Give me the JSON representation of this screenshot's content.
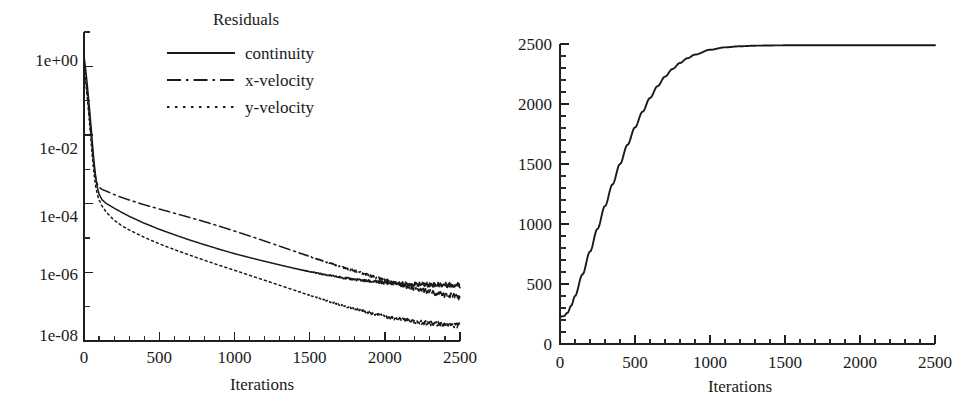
{
  "figure": {
    "background": "#ffffff",
    "ink": "#1a1a1a",
    "panel_count": 2
  },
  "chart_data": [
    {
      "id": "residuals-plot",
      "type": "line",
      "title": "Residuals",
      "xlabel": "Iterations",
      "ylabel": "",
      "yscale": "log",
      "xlim": [
        0,
        2500
      ],
      "ylim": [
        1e-08,
        10
      ],
      "grid": false,
      "legend_position": "top-center",
      "xticks": [
        0,
        500,
        1000,
        1500,
        2000,
        2500
      ],
      "xticklabels": [
        "0",
        "500",
        "1000",
        "1500",
        "2000",
        "2500"
      ],
      "yticks": [
        1,
        0.01,
        0.0001,
        1e-06,
        1e-08
      ],
      "yticklabels": [
        "1e+00",
        "1e-02",
        "1e-04",
        "1e-06",
        "1e-08"
      ],
      "minor_ticks": true,
      "series": [
        {
          "name": "continuity",
          "style": "solid",
          "x": [
            0,
            10,
            20,
            30,
            40,
            50,
            60,
            70,
            80,
            90,
            100,
            120,
            150,
            200,
            250,
            300,
            400,
            500,
            600,
            700,
            800,
            900,
            1000,
            1100,
            1200,
            1300,
            1400,
            1500,
            1600,
            1700,
            1800,
            1900,
            2000,
            2100,
            2200,
            2300,
            2400,
            2500
          ],
          "y": [
            2.0,
            0.9,
            0.35,
            0.12,
            0.04,
            0.012,
            0.0035,
            0.0012,
            0.0005,
            0.00028,
            0.00019,
            0.00013,
            0.0001,
            7.4e-05,
            5.6e-05,
            4.3e-05,
            2.7e-05,
            1.8e-05,
            1.25e-05,
            8.8e-06,
            6.4e-06,
            4.7e-06,
            3.5e-06,
            2.7e-06,
            2.1e-06,
            1.65e-06,
            1.3e-06,
            1.05e-06,
            8.6e-07,
            7.2e-07,
            6.2e-07,
            5.5e-07,
            5e-07,
            4.7e-07,
            4.5e-07,
            4.4e-07,
            4.35e-07,
            4.3e-07
          ]
        },
        {
          "name": "x-velocity",
          "style": "dash-dot",
          "x": [
            0,
            10,
            20,
            30,
            40,
            50,
            60,
            70,
            80,
            90,
            100,
            120,
            150,
            200,
            250,
            300,
            400,
            500,
            600,
            700,
            800,
            900,
            1000,
            1100,
            1200,
            1300,
            1400,
            1500,
            1600,
            1700,
            1800,
            1900,
            2000,
            2100,
            2200,
            2300,
            2400,
            2500
          ],
          "y": [
            1.2,
            0.5,
            0.2,
            0.07,
            0.022,
            0.007,
            0.0023,
            0.0009,
            0.0005,
            0.00036,
            0.0003,
            0.00026,
            0.00023,
            0.000185,
            0.000152,
            0.000128,
            9.3e-05,
            7e-05,
            5.3e-05,
            4e-05,
            3e-05,
            2.2e-05,
            1.6e-05,
            1.15e-05,
            8.2e-06,
            5.8e-06,
            4.1e-06,
            2.9e-06,
            2.05e-06,
            1.5e-06,
            1.1e-06,
            8e-07,
            6e-07,
            4.4e-07,
            3.4e-07,
            2.7e-07,
            2.2e-07,
            1.9e-07
          ]
        },
        {
          "name": "y-velocity",
          "style": "dotted",
          "x": [
            0,
            10,
            20,
            30,
            40,
            50,
            60,
            70,
            80,
            90,
            100,
            120,
            150,
            200,
            250,
            300,
            400,
            500,
            600,
            700,
            800,
            900,
            1000,
            1100,
            1200,
            1300,
            1400,
            1500,
            1600,
            1700,
            1800,
            1900,
            2000,
            2100,
            2200,
            2300,
            2400,
            2500
          ],
          "y": [
            1.0,
            0.4,
            0.15,
            0.05,
            0.015,
            0.0045,
            0.0014,
            0.00055,
            0.00028,
            0.00018,
            0.00013,
            8.6e-05,
            5.5e-05,
            3.3e-05,
            2.3e-05,
            1.72e-05,
            1.05e-05,
            6.8e-06,
            4.6e-06,
            3.2e-06,
            2.25e-06,
            1.6e-06,
            1.15e-06,
            8.2e-07,
            5.9e-07,
            4.2e-07,
            3e-07,
            2.15e-07,
            1.55e-07,
            1.15e-07,
            8.6e-08,
            6.6e-08,
            5.2e-08,
            4.3e-08,
            3.7e-08,
            3.3e-08,
            3e-08,
            2.8e-08
          ]
        }
      ]
    },
    {
      "id": "convergence-plot",
      "type": "line",
      "title": "",
      "xlabel": "Iterations",
      "ylabel": "",
      "yscale": "linear",
      "xlim": [
        0,
        2500
      ],
      "ylim": [
        0,
        2500
      ],
      "grid": false,
      "legend_position": "none",
      "xticks": [
        0,
        500,
        1000,
        1500,
        2000,
        2500
      ],
      "xticklabels": [
        "0",
        "500",
        "1000",
        "1500",
        "2000",
        "2500"
      ],
      "yticks": [
        0,
        500,
        1000,
        1500,
        2000,
        2500
      ],
      "yticklabels": [
        "0",
        "500",
        "1000",
        "1500",
        "2000",
        "2500"
      ],
      "minor_ticks": true,
      "series": [
        {
          "name": "value",
          "style": "solid",
          "x": [
            0,
            25,
            50,
            75,
            100,
            150,
            200,
            250,
            300,
            350,
            400,
            450,
            500,
            550,
            600,
            650,
            700,
            750,
            800,
            850,
            900,
            1000,
            1100,
            1200,
            1300,
            1400,
            1500,
            1600,
            1700,
            1800,
            1900,
            2000,
            2100,
            2200,
            2300,
            2400,
            2500
          ],
          "y": [
            228,
            232,
            260,
            320,
            400,
            580,
            770,
            960,
            1150,
            1330,
            1500,
            1660,
            1805,
            1935,
            2050,
            2148,
            2228,
            2292,
            2342,
            2382,
            2412,
            2452,
            2472,
            2481,
            2486,
            2488,
            2489,
            2490,
            2490,
            2490,
            2490,
            2490,
            2490,
            2490,
            2490,
            2490,
            2490
          ]
        }
      ]
    }
  ],
  "panels": {
    "left": {
      "legend": {
        "title": "Residuals",
        "entries": [
          {
            "label": "continuity",
            "style": "solid"
          },
          {
            "label": "x-velocity",
            "style": "dash-dot"
          },
          {
            "label": "y-velocity",
            "style": "dotted"
          }
        ]
      },
      "xlabel": "Iterations",
      "xticklabels": [
        "0",
        "500",
        "1000",
        "1500",
        "2000",
        "2500"
      ],
      "yticklabels": [
        "1e+00",
        "1e-02",
        "1e-04",
        "1e-06",
        "1e-08"
      ]
    },
    "right": {
      "xlabel": "Iterations",
      "xticklabels": [
        "0",
        "500",
        "1000",
        "1500",
        "2000",
        "2500"
      ],
      "yticklabels": [
        "0",
        "500",
        "1000",
        "1500",
        "2000",
        "2500"
      ]
    }
  }
}
